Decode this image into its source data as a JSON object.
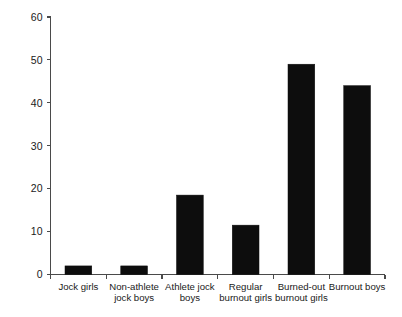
{
  "chart_data": {
    "type": "bar",
    "title": "",
    "subtitle": "",
    "xlabel": "",
    "ylabel": "",
    "categories": [
      "Jock girls",
      "Non-athlete jock boys",
      "Athlete jock boys",
      "Regular burnout girls",
      "Burned-out burnout girls",
      "Burnout boys"
    ],
    "category_lines": [
      [
        "Jock girls"
      ],
      [
        "Non-athlete",
        "jock boys"
      ],
      [
        "Athlete jock",
        "boys"
      ],
      [
        "Regular",
        "burnout girls"
      ],
      [
        "Burned-out",
        "burnout girls"
      ],
      [
        "Burnout boys"
      ]
    ],
    "values": [
      2,
      2,
      18.5,
      11.5,
      49,
      44
    ],
    "ylim": [
      0,
      60
    ],
    "yticks": [
      0,
      10,
      20,
      30,
      40,
      50,
      60
    ],
    "ytick_labels": [
      "0",
      "10",
      "20",
      "30",
      "40",
      "50",
      "60"
    ],
    "grid": false,
    "legend": null,
    "bar_color": "#0d0d0d",
    "axis_color": "#4a4a4a",
    "background": "#ffffff"
  }
}
